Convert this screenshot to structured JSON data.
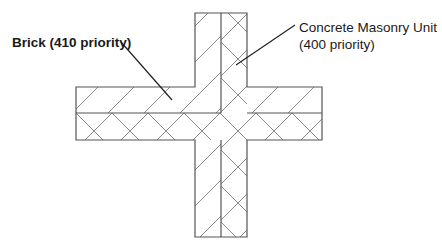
{
  "diagram": {
    "labels": {
      "brick": "Brick (410 priority)",
      "cmu_line1": "Concrete Masonry Unit",
      "cmu_line2": "(400 priority)"
    },
    "colors": {
      "outline": "#555555",
      "hatch": "#888888",
      "leader": "#222222",
      "text": "#1a1a1a",
      "background": "#ffffff"
    },
    "materials": [
      {
        "name": "Brick",
        "priority": 410,
        "hatch": "diagonal"
      },
      {
        "name": "Concrete Masonry Unit",
        "priority": 400,
        "hatch": "cross"
      }
    ]
  }
}
